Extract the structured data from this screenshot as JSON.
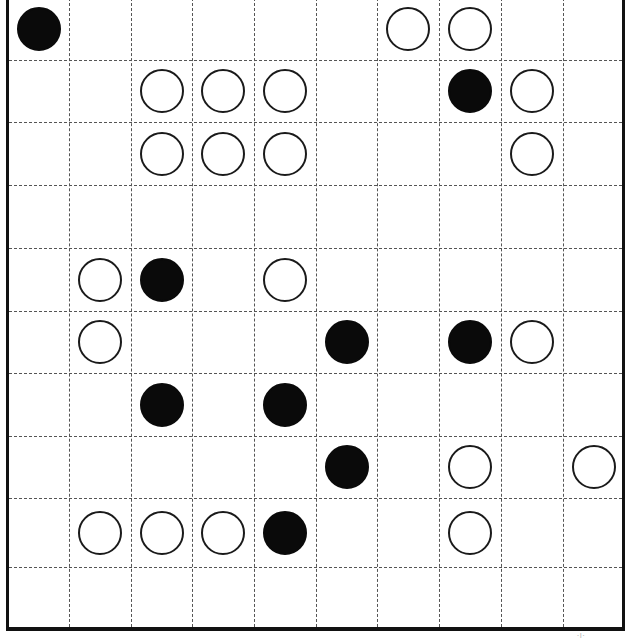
{
  "board": {
    "rows": 10,
    "cols": 10,
    "col_lines_x": [
      69,
      131,
      192,
      254,
      316,
      377,
      439,
      501,
      563
    ],
    "row_lines_y": [
      60,
      122,
      185,
      248,
      311,
      373,
      436,
      498,
      567
    ],
    "colors": {
      "white_stone_fill": "#ffffff",
      "white_stone_edge": "#1a1a1a",
      "black_stone": "#0a0a0a",
      "grid": "#555555",
      "border": "#111111"
    },
    "stones": [
      {
        "row": 0,
        "col": 0,
        "color": "black"
      },
      {
        "row": 0,
        "col": 6,
        "color": "white"
      },
      {
        "row": 0,
        "col": 7,
        "color": "white"
      },
      {
        "row": 1,
        "col": 2,
        "color": "white"
      },
      {
        "row": 1,
        "col": 3,
        "color": "white"
      },
      {
        "row": 1,
        "col": 4,
        "color": "white"
      },
      {
        "row": 1,
        "col": 7,
        "color": "black"
      },
      {
        "row": 1,
        "col": 8,
        "color": "white"
      },
      {
        "row": 2,
        "col": 2,
        "color": "white"
      },
      {
        "row": 2,
        "col": 3,
        "color": "white"
      },
      {
        "row": 2,
        "col": 4,
        "color": "white"
      },
      {
        "row": 2,
        "col": 8,
        "color": "white"
      },
      {
        "row": 4,
        "col": 1,
        "color": "white"
      },
      {
        "row": 4,
        "col": 2,
        "color": "black"
      },
      {
        "row": 4,
        "col": 4,
        "color": "white"
      },
      {
        "row": 5,
        "col": 1,
        "color": "white"
      },
      {
        "row": 5,
        "col": 5,
        "color": "black"
      },
      {
        "row": 5,
        "col": 7,
        "color": "black"
      },
      {
        "row": 5,
        "col": 8,
        "color": "white"
      },
      {
        "row": 6,
        "col": 2,
        "color": "black"
      },
      {
        "row": 6,
        "col": 4,
        "color": "black"
      },
      {
        "row": 7,
        "col": 5,
        "color": "black"
      },
      {
        "row": 7,
        "col": 7,
        "color": "white"
      },
      {
        "row": 7,
        "col": 9,
        "color": "white"
      },
      {
        "row": 8,
        "col": 1,
        "color": "white"
      },
      {
        "row": 8,
        "col": 2,
        "color": "white"
      },
      {
        "row": 8,
        "col": 3,
        "color": "white"
      },
      {
        "row": 8,
        "col": 4,
        "color": "black"
      },
      {
        "row": 8,
        "col": 7,
        "color": "white"
      }
    ]
  },
  "footer_mark": "·ı·"
}
